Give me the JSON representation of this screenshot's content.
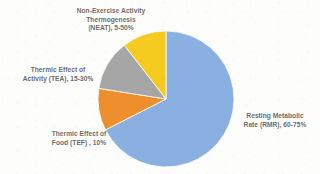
{
  "chart_data": {
    "type": "pie",
    "title": "",
    "subtitle": "",
    "xlabel": "",
    "ylabel": "",
    "grid": false,
    "legend_position": "none",
    "label_style": "outside-callout",
    "start_angle_deg": 0,
    "direction": "clockwise",
    "categories": [
      "Resting Metabolic Rate (RMR)",
      "Thermic Effect of Food (TEF)",
      "Thermic Effect of Activity (TEA)",
      "Non-Exercise Activity Thermogenesis (NEAT)"
    ],
    "values": [
      67.5,
      10,
      12,
      10.5
    ],
    "value_ranges": [
      "60-75%",
      "10%",
      "15-30%",
      "5-50%"
    ],
    "colors": [
      "#89b0e0",
      "#ef8e2c",
      "#a6a6a6",
      "#f5cb20"
    ],
    "slices": [
      {
        "name": "Resting Metabolic Rate (RMR)",
        "abbreviation": "RMR",
        "value": 67.5,
        "range_text": "60-75%",
        "color": "#89b0e0",
        "label": "Resting Metabolic\nRate (RMR), 60-75%"
      },
      {
        "name": "Thermic Effect of Food (TEF)",
        "abbreviation": "TEF",
        "value": 10,
        "range_text": "10%",
        "color": "#ef8e2c",
        "label": "Thermic Effect of\nFood (TEF) , 10%"
      },
      {
        "name": "Thermic Effect of Activity (TEA)",
        "abbreviation": "TEA",
        "value": 12,
        "range_text": "15-30%",
        "color": "#a6a6a6",
        "label": "Thermic Effect of\nActivity (TEA), 15-30%"
      },
      {
        "name": "Non-Exercise Activity Thermogenesis (NEAT)",
        "abbreviation": "NEAT",
        "value": 10.5,
        "range_text": "5-50%",
        "color": "#f5cb20",
        "label": "Non-Exercise Activity\nThermogenesis\n(NEAT), 5-50%"
      }
    ]
  },
  "labels": {
    "rmr": "Resting Metabolic\nRate (RMR), 60-75%",
    "tef": "Thermic Effect of\nFood (TEF) , 10%",
    "tea": "Thermic Effect of\nActivity (TEA), 15-30%",
    "neat": "Non-Exercise Activity\nThermogenesis\n(NEAT), 5-50%"
  },
  "geometry": {
    "center_x": 166,
    "center_y": 99,
    "radius": 68
  },
  "background_color": "#fdfdfc",
  "text_color": "#6d6d6d"
}
